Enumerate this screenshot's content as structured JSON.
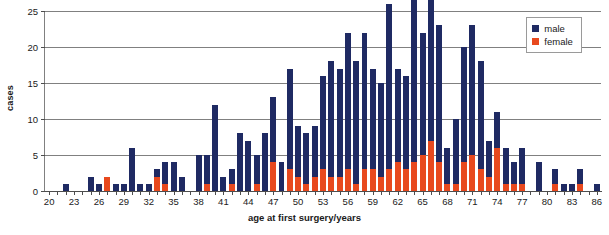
{
  "chart_data": {
    "type": "bar",
    "subtype": "stacked-bar",
    "title": "",
    "xlabel": "age at first surgery/years",
    "ylabel": "cases",
    "xlim": [
      19.5,
      86.5
    ],
    "ylim": [
      0,
      25
    ],
    "yticks": [
      0,
      5,
      10,
      15,
      20,
      25
    ],
    "xticks": [
      20,
      23,
      26,
      29,
      32,
      35,
      38,
      41,
      44,
      47,
      50,
      53,
      56,
      59,
      62,
      65,
      68,
      71,
      74,
      77,
      80,
      83,
      86
    ],
    "grid": "horizontal",
    "legend_position": "top-right",
    "categories": [
      20,
      21,
      22,
      23,
      24,
      25,
      26,
      27,
      28,
      29,
      30,
      31,
      32,
      33,
      34,
      35,
      36,
      37,
      38,
      39,
      40,
      41,
      42,
      43,
      44,
      45,
      46,
      47,
      48,
      49,
      50,
      51,
      52,
      53,
      54,
      55,
      56,
      57,
      58,
      59,
      60,
      61,
      62,
      63,
      64,
      65,
      66,
      67,
      68,
      69,
      70,
      71,
      72,
      73,
      74,
      75,
      76,
      77,
      78,
      79,
      80,
      81,
      82,
      83,
      84,
      85,
      86
    ],
    "series": [
      {
        "name": "male",
        "color": "#1f2a63",
        "values": [
          0,
          0,
          1,
          0,
          0,
          2,
          1,
          0,
          1,
          1,
          6,
          1,
          1,
          1,
          3,
          4,
          2,
          0,
          5,
          4,
          12,
          2,
          2,
          8,
          7,
          4,
          8,
          9,
          4,
          14,
          7,
          7,
          7,
          13,
          16,
          15,
          19,
          17,
          19,
          14,
          13,
          23,
          13,
          13,
          24,
          17,
          21,
          19,
          5,
          9,
          16,
          18,
          15,
          5,
          5,
          5,
          3,
          5,
          0,
          4,
          0,
          2,
          1,
          1,
          2,
          0,
          1
        ]
      },
      {
        "name": "female",
        "color": "#e8491e",
        "values": [
          0,
          0,
          0,
          0,
          0,
          0,
          0,
          2,
          0,
          0,
          0,
          0,
          0,
          2,
          1,
          0,
          0,
          0,
          0,
          1,
          0,
          0,
          1,
          0,
          0,
          1,
          0,
          4,
          0,
          3,
          2,
          1,
          2,
          3,
          2,
          2,
          3,
          1,
          3,
          3,
          2,
          3,
          4,
          3,
          4,
          5,
          7,
          4,
          1,
          1,
          4,
          5,
          3,
          2,
          6,
          1,
          1,
          1,
          0,
          0,
          0,
          1,
          0,
          0,
          1,
          0,
          0
        ]
      }
    ],
    "totals": [
      0,
      0,
      1,
      0,
      0,
      2,
      1,
      2,
      1,
      1,
      6,
      1,
      1,
      3,
      4,
      4,
      2,
      0,
      5,
      5,
      12,
      2,
      3,
      8,
      7,
      5,
      8,
      13,
      4,
      17,
      9,
      8,
      9,
      16,
      18,
      17,
      22,
      18,
      22,
      17,
      15,
      26,
      17,
      16,
      28,
      22,
      28,
      23,
      6,
      10,
      20,
      23,
      18,
      7,
      11,
      6,
      4,
      6,
      0,
      4,
      0,
      3,
      1,
      1,
      3,
      0,
      1
    ]
  },
  "legend": {
    "entries": [
      {
        "label": "male",
        "color": "#1f2a63"
      },
      {
        "label": "female",
        "color": "#e8491e"
      }
    ]
  }
}
